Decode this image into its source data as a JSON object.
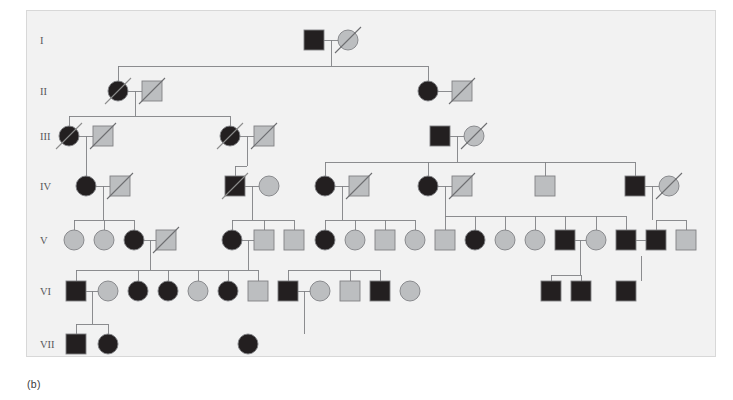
{
  "figure": {
    "caption": "(b)",
    "panel_bg": "#f2f2f2",
    "panel_border": "#d8d8d8",
    "line_color": "#808184",
    "affected_fill": "#231f20",
    "unaffected_fill": "#bcbec0",
    "symbol_stroke": "#808184",
    "slash_color": "#6d6e71",
    "generation_label_color": "#58595b"
  },
  "generations": [
    {
      "label": "I",
      "y": 40
    },
    {
      "label": "II",
      "y": 91
    },
    {
      "label": "III",
      "y": 136
    },
    {
      "label": "IV",
      "y": 186
    },
    {
      "label": "V",
      "y": 240
    },
    {
      "label": "VI",
      "y": 291
    },
    {
      "label": "VII",
      "y": 344
    }
  ],
  "legend_meaning": {
    "square": "male",
    "circle": "female",
    "filled": "affected",
    "gray": "unaffected",
    "slash": "deceased"
  },
  "individuals": [
    {
      "id": "I-1",
      "gen": "I",
      "sex": "square",
      "status": "affected",
      "deceased": false,
      "x": 314,
      "y": 40
    },
    {
      "id": "I-2",
      "gen": "I",
      "sex": "circle",
      "status": "unaffected",
      "deceased": true,
      "x": 348,
      "y": 40
    },
    {
      "id": "II-1",
      "gen": "II",
      "sex": "circle",
      "status": "affected",
      "deceased": true,
      "x": 118,
      "y": 91
    },
    {
      "id": "II-2",
      "gen": "II",
      "sex": "square",
      "status": "unaffected",
      "deceased": true,
      "x": 152,
      "y": 91
    },
    {
      "id": "II-3",
      "gen": "II",
      "sex": "circle",
      "status": "affected",
      "deceased": false,
      "x": 428,
      "y": 91
    },
    {
      "id": "II-4",
      "gen": "II",
      "sex": "square",
      "status": "unaffected",
      "deceased": true,
      "x": 462,
      "y": 91
    },
    {
      "id": "III-1",
      "gen": "III",
      "sex": "circle",
      "status": "affected",
      "deceased": true,
      "x": 69,
      "y": 136
    },
    {
      "id": "III-2",
      "gen": "III",
      "sex": "square",
      "status": "unaffected",
      "deceased": true,
      "x": 103,
      "y": 136
    },
    {
      "id": "III-3",
      "gen": "III",
      "sex": "circle",
      "status": "affected",
      "deceased": true,
      "x": 230,
      "y": 136
    },
    {
      "id": "III-4",
      "gen": "III",
      "sex": "square",
      "status": "unaffected",
      "deceased": true,
      "x": 264,
      "y": 136
    },
    {
      "id": "III-5",
      "gen": "III",
      "sex": "square",
      "status": "affected",
      "deceased": false,
      "x": 440,
      "y": 136
    },
    {
      "id": "III-6",
      "gen": "III",
      "sex": "circle",
      "status": "unaffected",
      "deceased": true,
      "x": 474,
      "y": 136
    },
    {
      "id": "IV-1",
      "gen": "IV",
      "sex": "circle",
      "status": "affected",
      "deceased": false,
      "x": 86,
      "y": 186
    },
    {
      "id": "IV-2",
      "gen": "IV",
      "sex": "square",
      "status": "unaffected",
      "deceased": true,
      "x": 120,
      "y": 186
    },
    {
      "id": "IV-3",
      "gen": "IV",
      "sex": "square",
      "status": "affected",
      "deceased": true,
      "x": 235,
      "y": 186
    },
    {
      "id": "IV-4",
      "gen": "IV",
      "sex": "circle",
      "status": "unaffected",
      "deceased": false,
      "x": 269,
      "y": 186
    },
    {
      "id": "IV-5",
      "gen": "IV",
      "sex": "circle",
      "status": "affected",
      "deceased": false,
      "x": 325,
      "y": 186
    },
    {
      "id": "IV-6",
      "gen": "IV",
      "sex": "square",
      "status": "unaffected",
      "deceased": true,
      "x": 359,
      "y": 186
    },
    {
      "id": "IV-7",
      "gen": "IV",
      "sex": "circle",
      "status": "affected",
      "deceased": false,
      "x": 428,
      "y": 186
    },
    {
      "id": "IV-8",
      "gen": "IV",
      "sex": "square",
      "status": "unaffected",
      "deceased": true,
      "x": 462,
      "y": 186
    },
    {
      "id": "IV-9",
      "gen": "IV",
      "sex": "square",
      "status": "unaffected",
      "deceased": false,
      "x": 545,
      "y": 186
    },
    {
      "id": "IV-10",
      "gen": "IV",
      "sex": "square",
      "status": "affected",
      "deceased": false,
      "x": 635,
      "y": 186
    },
    {
      "id": "IV-11",
      "gen": "IV",
      "sex": "circle",
      "status": "unaffected",
      "deceased": true,
      "x": 669,
      "y": 186
    },
    {
      "id": "V-1",
      "gen": "V",
      "sex": "circle",
      "status": "unaffected",
      "deceased": false,
      "x": 74,
      "y": 240
    },
    {
      "id": "V-2",
      "gen": "V",
      "sex": "circle",
      "status": "unaffected",
      "deceased": false,
      "x": 104,
      "y": 240
    },
    {
      "id": "V-3",
      "gen": "V",
      "sex": "circle",
      "status": "affected",
      "deceased": false,
      "x": 134,
      "y": 240
    },
    {
      "id": "V-4",
      "gen": "V",
      "sex": "square",
      "status": "unaffected",
      "deceased": true,
      "x": 166,
      "y": 240
    },
    {
      "id": "V-5",
      "gen": "V",
      "sex": "circle",
      "status": "affected",
      "deceased": false,
      "x": 232,
      "y": 240
    },
    {
      "id": "V-6",
      "gen": "V",
      "sex": "square",
      "status": "unaffected",
      "deceased": false,
      "x": 264,
      "y": 240
    },
    {
      "id": "V-7",
      "gen": "V",
      "sex": "square",
      "status": "unaffected",
      "deceased": false,
      "x": 294,
      "y": 240
    },
    {
      "id": "V-8",
      "gen": "V",
      "sex": "circle",
      "status": "affected",
      "deceased": false,
      "x": 325,
      "y": 240
    },
    {
      "id": "V-9",
      "gen": "V",
      "sex": "circle",
      "status": "unaffected",
      "deceased": false,
      "x": 355,
      "y": 240
    },
    {
      "id": "V-10",
      "gen": "V",
      "sex": "square",
      "status": "unaffected",
      "deceased": false,
      "x": 385,
      "y": 240
    },
    {
      "id": "V-11",
      "gen": "V",
      "sex": "circle",
      "status": "unaffected",
      "deceased": false,
      "x": 415,
      "y": 240
    },
    {
      "id": "V-12",
      "gen": "V",
      "sex": "square",
      "status": "unaffected",
      "deceased": false,
      "x": 445,
      "y": 240
    },
    {
      "id": "V-13",
      "gen": "V",
      "sex": "circle",
      "status": "affected",
      "deceased": false,
      "x": 475,
      "y": 240
    },
    {
      "id": "V-14",
      "gen": "V",
      "sex": "circle",
      "status": "unaffected",
      "deceased": false,
      "x": 505,
      "y": 240
    },
    {
      "id": "V-15",
      "gen": "V",
      "sex": "circle",
      "status": "unaffected",
      "deceased": false,
      "x": 535,
      "y": 240
    },
    {
      "id": "V-16",
      "gen": "V",
      "sex": "square",
      "status": "affected",
      "deceased": false,
      "x": 565,
      "y": 240
    },
    {
      "id": "V-17",
      "gen": "V",
      "sex": "circle",
      "status": "unaffected",
      "deceased": false,
      "x": 596,
      "y": 240
    },
    {
      "id": "V-18",
      "gen": "V",
      "sex": "square",
      "status": "affected",
      "deceased": false,
      "x": 626,
      "y": 240
    },
    {
      "id": "V-19",
      "gen": "V",
      "sex": "square",
      "status": "affected",
      "deceased": false,
      "x": 656,
      "y": 240
    },
    {
      "id": "V-20",
      "gen": "V",
      "sex": "square",
      "status": "unaffected",
      "deceased": false,
      "x": 686,
      "y": 240
    },
    {
      "id": "VI-1",
      "gen": "VI",
      "sex": "square",
      "status": "affected",
      "deceased": false,
      "x": 76,
      "y": 291
    },
    {
      "id": "VI-2",
      "gen": "VI",
      "sex": "circle",
      "status": "unaffected",
      "deceased": false,
      "x": 108,
      "y": 291
    },
    {
      "id": "VI-3",
      "gen": "VI",
      "sex": "circle",
      "status": "affected",
      "deceased": false,
      "x": 138,
      "y": 291
    },
    {
      "id": "VI-4",
      "gen": "VI",
      "sex": "circle",
      "status": "affected",
      "deceased": false,
      "x": 168,
      "y": 291
    },
    {
      "id": "VI-5",
      "gen": "VI",
      "sex": "circle",
      "status": "unaffected",
      "deceased": false,
      "x": 198,
      "y": 291
    },
    {
      "id": "VI-6",
      "gen": "VI",
      "sex": "circle",
      "status": "affected",
      "deceased": false,
      "x": 228,
      "y": 291
    },
    {
      "id": "VI-7",
      "gen": "VI",
      "sex": "square",
      "status": "unaffected",
      "deceased": false,
      "x": 258,
      "y": 291
    },
    {
      "id": "VI-8",
      "gen": "VI",
      "sex": "square",
      "status": "affected",
      "deceased": false,
      "x": 288,
      "y": 291
    },
    {
      "id": "VI-9",
      "gen": "VI",
      "sex": "circle",
      "status": "unaffected",
      "deceased": false,
      "x": 320,
      "y": 291
    },
    {
      "id": "VI-10",
      "gen": "VI",
      "sex": "square",
      "status": "unaffected",
      "deceased": false,
      "x": 350,
      "y": 291
    },
    {
      "id": "VI-11",
      "gen": "VI",
      "sex": "square",
      "status": "affected",
      "deceased": false,
      "x": 380,
      "y": 291
    },
    {
      "id": "VI-12",
      "gen": "VI",
      "sex": "circle",
      "status": "unaffected",
      "deceased": false,
      "x": 410,
      "y": 291
    },
    {
      "id": "VI-13",
      "gen": "VI",
      "sex": "square",
      "status": "affected",
      "deceased": false,
      "x": 551,
      "y": 291
    },
    {
      "id": "VI-14",
      "gen": "VI",
      "sex": "square",
      "status": "affected",
      "deceased": false,
      "x": 581,
      "y": 291
    },
    {
      "id": "VI-15",
      "gen": "VI",
      "sex": "square",
      "status": "affected",
      "deceased": false,
      "x": 626,
      "y": 291
    },
    {
      "id": "VII-1",
      "gen": "VII",
      "sex": "square",
      "status": "affected",
      "deceased": false,
      "x": 76,
      "y": 344
    },
    {
      "id": "VII-2",
      "gen": "VII",
      "sex": "circle",
      "status": "affected",
      "deceased": false,
      "x": 108,
      "y": 344
    },
    {
      "id": "VII-3",
      "gen": "VII",
      "sex": "circle",
      "status": "affected",
      "deceased": false,
      "x": 248,
      "y": 344
    }
  ],
  "connectors": {
    "mating_lines": [
      {
        "x1": 314,
        "x2": 348,
        "y": 40
      },
      {
        "x1": 118,
        "x2": 152,
        "y": 91
      },
      {
        "x1": 428,
        "x2": 462,
        "y": 91
      },
      {
        "x1": 69,
        "x2": 103,
        "y": 136
      },
      {
        "x1": 230,
        "x2": 264,
        "y": 136
      },
      {
        "x1": 440,
        "x2": 474,
        "y": 136
      },
      {
        "x1": 86,
        "x2": 120,
        "y": 186
      },
      {
        "x1": 235,
        "x2": 269,
        "y": 186
      },
      {
        "x1": 325,
        "x2": 359,
        "y": 186
      },
      {
        "x1": 428,
        "x2": 462,
        "y": 186
      },
      {
        "x1": 635,
        "x2": 669,
        "y": 186
      },
      {
        "x1": 134,
        "x2": 166,
        "y": 240
      },
      {
        "x1": 232,
        "x2": 264,
        "y": 240
      },
      {
        "x1": 565,
        "x2": 596,
        "y": 240
      },
      {
        "x1": 626,
        "x2": 656,
        "y": 240
      },
      {
        "x1": 76,
        "x2": 108,
        "y": 291
      },
      {
        "x1": 288,
        "x2": 320,
        "y": 291
      }
    ],
    "sibship_bars": [
      {
        "y": 66,
        "x1": 118,
        "x2": 428,
        "drop_from_x": 331,
        "drop_from_y": 40,
        "children_x": [
          118,
          428
        ]
      },
      {
        "y": 116,
        "x1": 69,
        "x2": 230,
        "drop_from_x": 135,
        "drop_from_y": 91,
        "children_x": [
          69,
          230
        ]
      },
      {
        "y": 166,
        "x1": 86,
        "x2": 86,
        "drop_from_x": 86,
        "drop_from_y": 136,
        "children_x": [
          86
        ]
      },
      {
        "y": 166,
        "x1": 235,
        "x2": 235,
        "drop_from_x": 247,
        "drop_from_y": 136,
        "children_x": [
          235
        ]
      },
      {
        "y": 162,
        "x1": 325,
        "x2": 635,
        "drop_from_x": 457,
        "drop_from_y": 136,
        "children_x": [
          325,
          428,
          545,
          635
        ]
      },
      {
        "y": 220,
        "x1": 74,
        "x2": 134,
        "drop_from_x": 103,
        "drop_from_y": 186,
        "children_x": [
          74,
          104,
          134
        ]
      },
      {
        "y": 220,
        "x1": 232,
        "x2": 294,
        "drop_from_x": 252,
        "drop_from_y": 186,
        "children_x": [
          232,
          264,
          294
        ]
      },
      {
        "y": 220,
        "x1": 325,
        "x2": 415,
        "drop_from_x": 342,
        "drop_from_y": 186,
        "children_x": [
          325,
          355,
          385,
          415
        ]
      },
      {
        "y": 216,
        "x1": 445,
        "x2": 626,
        "drop_from_x": 445,
        "drop_from_y": 186,
        "children_x": [
          445,
          475,
          505,
          535,
          565,
          596,
          626
        ]
      },
      {
        "y": 220,
        "x1": 656,
        "x2": 686,
        "drop_from_x": 652,
        "drop_from_y": 186,
        "children_x": [
          656,
          686
        ]
      },
      {
        "y": 270,
        "x1": 76,
        "x2": 258,
        "drop_from_x": 150,
        "drop_from_y": 240,
        "children_x": [
          76,
          138,
          168,
          198,
          228,
          258
        ]
      },
      {
        "y": 270,
        "x1": 288,
        "x2": 380,
        "drop_from_x": 248,
        "drop_from_y": 240,
        "children_x": [
          288,
          350,
          380
        ]
      },
      {
        "y": 275,
        "x1": 551,
        "x2": 581,
        "drop_from_x": 580,
        "drop_from_y": 240,
        "children_x": [
          551,
          581
        ]
      },
      {
        "y": 324,
        "x1": 76,
        "x2": 108,
        "drop_from_x": 92,
        "drop_from_y": 291,
        "children_x": [
          76,
          108
        ]
      }
    ],
    "single_drops": [
      {
        "x": 304,
        "y1": 291,
        "y2": 344
      },
      {
        "x": 641,
        "y1": 256,
        "y2": 291
      }
    ]
  }
}
